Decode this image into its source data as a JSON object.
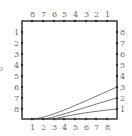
{
  "figure": {
    "side_letter": "b",
    "box": {
      "x": 22,
      "y": 21,
      "width": 95,
      "height": 98
    },
    "top_labels": [
      "8",
      "7",
      "6",
      "5",
      "4",
      "3",
      "2",
      "1"
    ],
    "bottom_labels": [
      "1",
      "2",
      "3",
      "4",
      "5",
      "6",
      "7",
      "8"
    ],
    "left_labels": [
      "1",
      "2",
      "3",
      "4",
      "5",
      "6",
      "7",
      "8"
    ],
    "right_labels": [
      "8",
      "7",
      "6",
      "5",
      "4",
      "3",
      "2",
      "1"
    ],
    "curves": [
      {
        "from": "bottom-1",
        "to": "right-3"
      },
      {
        "from": "bottom-2",
        "to": "right-2"
      },
      {
        "from": "bottom-3",
        "to": "right-1"
      }
    ],
    "colors": {
      "frame": "#2a2a2a",
      "curve": "#3a3a3a",
      "label": "#6a6a6a"
    }
  }
}
